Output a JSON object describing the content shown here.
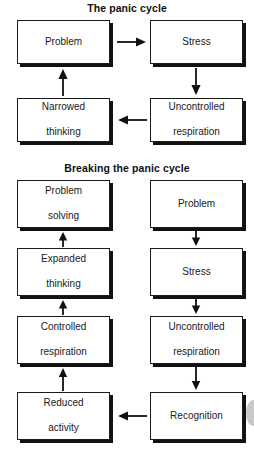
{
  "figure": {
    "sections": [
      {
        "id": "panic-cycle",
        "title": "The panic cycle",
        "nodes": [
          {
            "id": "panic-problem",
            "label": "Problem",
            "column": "left",
            "top": 20
          },
          {
            "id": "panic-stress",
            "label": "Stress",
            "column": "right",
            "top": 20
          },
          {
            "id": "panic-uncontrolled",
            "label": "Uncontrolled respiration",
            "column": "right",
            "top": 98
          },
          {
            "id": "panic-narrowed",
            "label": "Narrowed thinking",
            "column": "left",
            "top": 98
          }
        ],
        "edges": [
          {
            "from": "panic-problem",
            "to": "panic-stress",
            "direction": "right"
          },
          {
            "from": "panic-stress",
            "to": "panic-uncontrolled",
            "direction": "down"
          },
          {
            "from": "panic-uncontrolled",
            "to": "panic-narrowed",
            "direction": "left"
          },
          {
            "from": "panic-narrowed",
            "to": "panic-problem",
            "direction": "up"
          }
        ]
      },
      {
        "id": "breaking-panic-cycle",
        "title": "Breaking the panic cycle",
        "nodes": [
          {
            "id": "break-problem-solving",
            "label": "Problem solving",
            "column": "left",
            "top": 180
          },
          {
            "id": "break-problem",
            "label": "Problem",
            "column": "right",
            "top": 180
          },
          {
            "id": "break-expanded",
            "label": "Expanded thinking",
            "column": "left",
            "top": 248
          },
          {
            "id": "break-stress",
            "label": "Stress",
            "column": "right",
            "top": 248
          },
          {
            "id": "break-controlled",
            "label": "Controlled respiration",
            "column": "left",
            "top": 316
          },
          {
            "id": "break-uncontrolled",
            "label": "Uncontrolled respiration",
            "column": "right",
            "top": 316
          },
          {
            "id": "break-reduced",
            "label": "Reduced activity",
            "column": "left",
            "top": 392
          },
          {
            "id": "break-recognition",
            "label": "Recognition",
            "column": "right",
            "top": 392
          }
        ],
        "edges": [
          {
            "from": "break-problem",
            "to": "break-stress",
            "direction": "down"
          },
          {
            "from": "break-stress",
            "to": "break-uncontrolled",
            "direction": "down"
          },
          {
            "from": "break-uncontrolled",
            "to": "break-recognition",
            "direction": "down"
          },
          {
            "from": "break-recognition",
            "to": "break-reduced",
            "direction": "left"
          },
          {
            "from": "break-reduced",
            "to": "break-controlled",
            "direction": "up"
          },
          {
            "from": "break-controlled",
            "to": "break-expanded",
            "direction": "up"
          },
          {
            "from": "break-expanded",
            "to": "break-problem-solving",
            "direction": "up"
          }
        ]
      }
    ],
    "labels": {
      "panic_problem": "Problem",
      "panic_stress": "Stress",
      "panic_uncontrolled_l1": "Uncontrolled",
      "panic_uncontrolled_l2": "respiration",
      "panic_narrowed_l1": "Narrowed",
      "panic_narrowed_l2": "thinking",
      "break_problem_solving_l1": "Problem",
      "break_problem_solving_l2": "solving",
      "break_problem": "Problem",
      "break_expanded_l1": "Expanded",
      "break_expanded_l2": "thinking",
      "break_stress": "Stress",
      "break_controlled_l1": "Controlled",
      "break_controlled_l2": "respiration",
      "break_uncontrolled_l1": "Uncontrolled",
      "break_uncontrolled_l2": "respiration",
      "break_reduced_l1": "Reduced",
      "break_reduced_l2": "activity",
      "break_recognition": "Recognition"
    },
    "colors": {
      "box_fill": "#ffffff",
      "box_border": "#1b1b1b",
      "box_shadow": "#111111",
      "text": "#1a1a1a",
      "background": "#ffffff",
      "artifact": "#c9c9c9"
    }
  }
}
